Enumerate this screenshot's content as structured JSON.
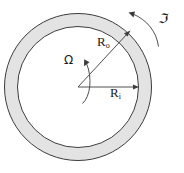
{
  "figure": {
    "background_color": "#ffffff",
    "ring_fill_color": "#e3e3e3",
    "stroke_color": "#3c3c3c",
    "label_color": "#1a1a1a"
  },
  "geometry": {
    "center_x": 78,
    "center_y": 87,
    "outer_radius": 74,
    "inner_radius": 61,
    "outer_diameter": 148,
    "inner_diameter": 122
  },
  "labels": {
    "outer_radius": {
      "symbol": "R",
      "subscript": "o",
      "full": "Ro"
    },
    "inner_radius": {
      "symbol": "R",
      "subscript": "i",
      "full": "Ri"
    },
    "angular_velocity": {
      "symbol": "Ω",
      "name": "Omega"
    },
    "rotation": {
      "symbol": "ℑ",
      "name": "fraktur-J"
    }
  },
  "annotations": [
    {
      "name": "outer-radius-leader",
      "type": "arrow",
      "from": [
        78,
        87
      ],
      "to": [
        129,
        33
      ],
      "label": "Ro"
    },
    {
      "name": "inner-radius-leader",
      "type": "arrow",
      "from": [
        78,
        87
      ],
      "to": [
        138,
        87
      ],
      "label": "Ri"
    },
    {
      "name": "angular-velocity-arc",
      "type": "curved-arrow",
      "label": "Ω",
      "direction": "counterclockwise"
    },
    {
      "name": "rotation-arc",
      "type": "curved-arrow",
      "label": "ℑ",
      "direction": "counterclockwise"
    }
  ]
}
